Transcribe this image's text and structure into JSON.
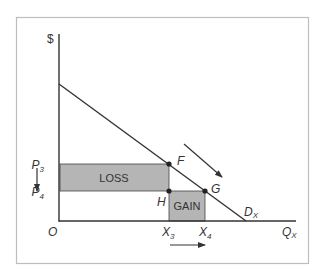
{
  "diagram": {
    "type": "supply-demand-welfare",
    "y_axis_label": "$",
    "x_axis_label": {
      "main": "Q",
      "sub": "X"
    },
    "origin_label": "O",
    "demand_label": {
      "main": "D",
      "sub": "X"
    },
    "price_labels": [
      {
        "main": "P",
        "sub": "3"
      },
      {
        "main": "P",
        "sub": "4"
      }
    ],
    "quantity_labels": [
      {
        "main": "X",
        "sub": "3"
      },
      {
        "main": "X",
        "sub": "4"
      }
    ],
    "points": [
      "F",
      "G",
      "H"
    ],
    "regions": {
      "loss": "LOSS",
      "gain": "GAIN"
    },
    "colors": {
      "shade": "#b3b3b3",
      "line": "#333333",
      "frame": "#bbbbbb"
    }
  }
}
